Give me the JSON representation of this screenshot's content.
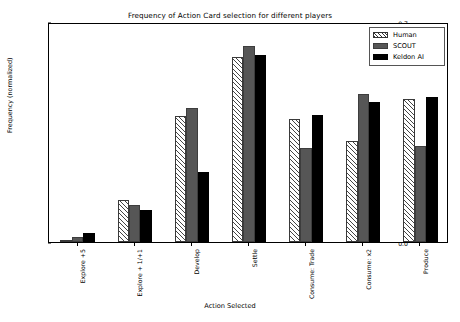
{
  "chart_data": {
    "type": "bar",
    "title": "Frequency of Action Card selection for different players",
    "xlabel": "Action Selected",
    "ylabel": "Frequency (normalized)",
    "categories": [
      "Explore +5",
      "Explore + 1/+1",
      "Develop",
      "Settle",
      "Consume: Trade",
      "Consume: x2",
      "Produce"
    ],
    "series": [
      {
        "name": "Human",
        "style": "hatched-white",
        "color": "#ffffff",
        "values": [
          0.005,
          0.135,
          0.4,
          0.59,
          0.393,
          0.322,
          0.455
        ]
      },
      {
        "name": "SCOUT",
        "style": "solid-gray",
        "color": "#565656",
        "values": [
          0.016,
          0.119,
          0.427,
          0.624,
          0.3,
          0.47,
          0.305
        ]
      },
      {
        "name": "Keldon AI",
        "style": "solid-black",
        "color": "#000000",
        "values": [
          0.028,
          0.101,
          0.224,
          0.594,
          0.403,
          0.447,
          0.463
        ]
      }
    ],
    "ylim": [
      0.0,
      0.7
    ],
    "yticks": [
      "0.0",
      "0.1",
      "0.2",
      "0.3",
      "0.4",
      "0.5",
      "0.6",
      "0.7"
    ],
    "ytick_values": [
      0.0,
      0.1,
      0.2,
      0.3,
      0.4,
      0.5,
      0.6,
      0.7
    ],
    "grid": false,
    "legend_position": "upper right"
  },
  "legend": {
    "entries": [
      {
        "label": "Human"
      },
      {
        "label": "SCOUT"
      },
      {
        "label": "Keldon AI"
      }
    ]
  }
}
